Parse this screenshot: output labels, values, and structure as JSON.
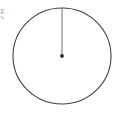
{
  "figure": {
    "background_color": "#ffffff",
    "stroke_color": "#3f3f46",
    "radius_line_color": "#6b6b72",
    "center_dot_color": "#1a1a1a",
    "partial_edge_label": "5",
    "partial_edge_label_color": "#b9b9b9",
    "elements": {
      "circle_name": "circle-outline",
      "radius_name": "radius-segment",
      "center_name": "center-point"
    }
  },
  "geometry": {
    "circle": {
      "center_x": 62,
      "center_y": 56,
      "radius_x": 49,
      "radius_y": 48,
      "stroke_width": 1.1
    },
    "radius_segment": {
      "x1": 62,
      "y1": 8,
      "x2": 62,
      "y2": 55,
      "stroke_width": 1
    },
    "center_dot": {
      "cx": 62,
      "cy": 56,
      "size": 3.2
    }
  },
  "canvas": {
    "width": 116,
    "height": 122
  }
}
